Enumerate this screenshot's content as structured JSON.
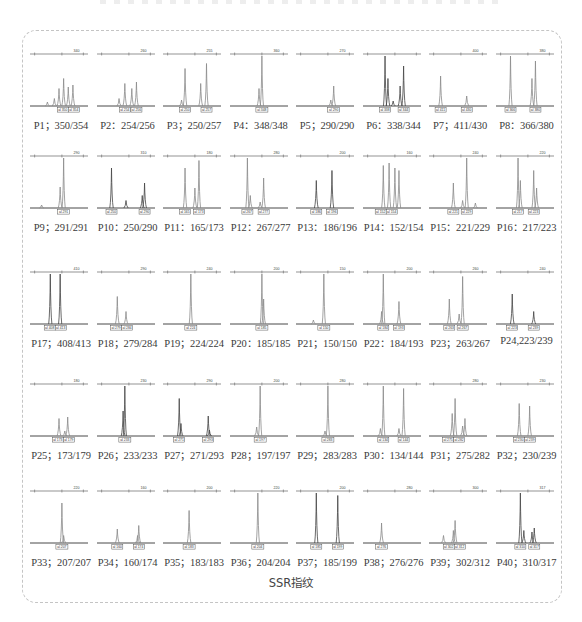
{
  "figure": {
    "caption": "SSR指纹",
    "grid": {
      "columns": 8,
      "rows": 5
    },
    "colors": {
      "trace": "#8a8a8a",
      "trace_dark": "#444444",
      "axis": "#555555",
      "frame": "#c4c4c4"
    }
  },
  "panels": [
    {
      "id": "P1",
      "label": "P1；350/354",
      "alleles": [
        "350",
        "354"
      ],
      "ruler": "340",
      "peaks": [
        [
          0.5,
          0.35
        ],
        [
          0.58,
          0.55
        ],
        [
          0.66,
          0.38
        ],
        [
          0.74,
          0.42
        ],
        [
          0.42,
          0.15
        ],
        [
          0.3,
          0.08
        ]
      ],
      "dark": false
    },
    {
      "id": "P2",
      "label": "P2：254/256",
      "alleles": [
        "254",
        "256"
      ],
      "ruler": "260",
      "peaks": [
        [
          0.48,
          0.45
        ],
        [
          0.6,
          0.35
        ],
        [
          0.68,
          0.48
        ],
        [
          0.38,
          0.15
        ]
      ],
      "dark": false
    },
    {
      "id": "P3",
      "label": "P3；250/257",
      "alleles": [
        "250",
        "257"
      ],
      "ruler": "255",
      "peaks": [
        [
          0.38,
          0.75
        ],
        [
          0.65,
          0.45
        ],
        [
          0.75,
          0.85
        ],
        [
          0.32,
          0.12
        ]
      ],
      "dark": false
    },
    {
      "id": "P4",
      "label": "P4：348/348",
      "alleles": [
        "348"
      ],
      "ruler": "360",
      "peaks": [
        [
          0.55,
          1.0
        ],
        [
          0.5,
          0.35
        ]
      ],
      "dark": false
    },
    {
      "id": "P5",
      "label": "P5；290/290",
      "alleles": [
        "290"
      ],
      "ruler": "270",
      "peaks": [
        [
          0.65,
          0.4
        ],
        [
          0.6,
          0.12
        ]
      ],
      "dark": false
    },
    {
      "id": "P6",
      "label": "P6：338/344",
      "alleles": [
        "338",
        "344"
      ],
      "ruler": "",
      "peaks": [
        [
          0.38,
          1.0
        ],
        [
          0.43,
          0.55
        ],
        [
          0.7,
          0.8
        ],
        [
          0.64,
          0.4
        ],
        [
          0.52,
          0.1
        ]
      ],
      "dark": true
    },
    {
      "id": "P7",
      "label": "P7；411/430",
      "alleles": [
        "411",
        "430"
      ],
      "ruler": "400",
      "peaks": [
        [
          0.2,
          0.6
        ],
        [
          0.65,
          0.2
        ]
      ],
      "dark": false
    },
    {
      "id": "P8",
      "label": "P8：366/380",
      "alleles": [
        "366",
        "380"
      ],
      "ruler": "380",
      "peaks": [
        [
          0.25,
          1.0
        ],
        [
          0.62,
          0.55
        ],
        [
          0.68,
          0.9
        ]
      ],
      "dark": false
    },
    {
      "id": "P9",
      "label": "P9；291/291",
      "alleles": [
        "291"
      ],
      "ruler": "290",
      "peaks": [
        [
          0.58,
          1.0
        ],
        [
          0.52,
          0.42
        ],
        [
          0.2,
          0.06
        ]
      ],
      "dark": false
    },
    {
      "id": "P10",
      "label": "P10：250/290",
      "alleles": [
        "250",
        "290"
      ],
      "ruler": "310",
      "peaks": [
        [
          0.25,
          0.8
        ],
        [
          0.5,
          0.15
        ],
        [
          0.82,
          0.5
        ],
        [
          0.78,
          0.25
        ]
      ],
      "dark": true
    },
    {
      "id": "P11",
      "label": "P11：165/173",
      "alleles": [
        "165",
        "173"
      ],
      "ruler": "180",
      "peaks": [
        [
          0.38,
          0.8
        ],
        [
          0.55,
          0.4
        ],
        [
          0.62,
          0.95
        ]
      ],
      "dark": false
    },
    {
      "id": "P12",
      "label": "P12：267/277",
      "alleles": [
        "267",
        "277"
      ],
      "ruler": "280",
      "peaks": [
        [
          0.3,
          1.0
        ],
        [
          0.35,
          0.25
        ],
        [
          0.58,
          0.6
        ],
        [
          0.52,
          0.12
        ]
      ],
      "dark": false
    },
    {
      "id": "P13",
      "label": "P13：186/196",
      "alleles": [
        "186",
        "196"
      ],
      "ruler": "200",
      "peaks": [
        [
          0.35,
          0.55
        ],
        [
          0.62,
          0.75
        ]
      ],
      "dark": true
    },
    {
      "id": "P14",
      "label": "P14：152/154",
      "alleles": [
        "152",
        "154"
      ],
      "ruler": "160",
      "peaks": [
        [
          0.35,
          0.85
        ],
        [
          0.45,
          0.9
        ],
        [
          0.55,
          0.8
        ],
        [
          0.62,
          0.75
        ]
      ],
      "dark": false
    },
    {
      "id": "P15",
      "label": "P15：221/229",
      "alleles": [
        "221",
        "229"
      ],
      "ruler": "240",
      "peaks": [
        [
          0.42,
          0.5
        ],
        [
          0.65,
          1.0
        ],
        [
          0.58,
          0.15
        ],
        [
          0.8,
          0.1
        ]
      ],
      "dark": false
    },
    {
      "id": "P16",
      "label": "P16：217/223",
      "alleles": [
        "217",
        "223"
      ],
      "ruler": "220",
      "peaks": [
        [
          0.38,
          1.0
        ],
        [
          0.42,
          0.55
        ],
        [
          0.65,
          0.75
        ],
        [
          0.7,
          0.4
        ]
      ],
      "dark": false
    },
    {
      "id": "P17",
      "label": "P17；408/413",
      "alleles": [
        "408",
        "413"
      ],
      "ruler": "410",
      "peaks": [
        [
          0.35,
          1.0
        ],
        [
          0.52,
          1.0
        ]
      ],
      "dark": true
    },
    {
      "id": "P18",
      "label": "P18；279/284",
      "alleles": [
        "279",
        "284"
      ],
      "ruler": "290",
      "peaks": [
        [
          0.35,
          0.55
        ],
        [
          0.5,
          0.25
        ]
      ],
      "dark": false
    },
    {
      "id": "P19",
      "label": "P19；224/224",
      "alleles": [
        "224"
      ],
      "ruler": "240",
      "peaks": [
        [
          0.48,
          1.0
        ]
      ],
      "dark": false
    },
    {
      "id": "P20",
      "label": "P20：185/185",
      "alleles": [
        "185"
      ],
      "ruler": "200",
      "peaks": [
        [
          0.55,
          1.0
        ],
        [
          0.58,
          0.5
        ]
      ],
      "dark": false
    },
    {
      "id": "P21",
      "label": "P21；150/150",
      "alleles": [
        "150"
      ],
      "ruler": "150",
      "peaks": [
        [
          0.48,
          1.0
        ],
        [
          0.3,
          0.08
        ]
      ],
      "dark": false
    },
    {
      "id": "P22",
      "label": "P22：184/193",
      "alleles": [
        "184",
        "193"
      ],
      "ruler": "200",
      "peaks": [
        [
          0.35,
          1.0
        ],
        [
          0.32,
          0.25
        ],
        [
          0.62,
          0.45
        ]
      ],
      "dark": false
    },
    {
      "id": "P23",
      "label": "P23；263/267",
      "alleles": [
        "263",
        "267"
      ],
      "ruler": "260",
      "peaks": [
        [
          0.35,
          0.5
        ],
        [
          0.58,
          0.95
        ],
        [
          0.52,
          0.2
        ]
      ],
      "dark": false
    },
    {
      "id": "P24",
      "label": "P24,223/239",
      "alleles": [
        "223",
        "239"
      ],
      "ruler": "240",
      "peaks": [
        [
          0.28,
          0.6
        ],
        [
          0.65,
          0.25
        ]
      ],
      "dark": true
    },
    {
      "id": "P25",
      "label": "P25；173/179",
      "alleles": [
        "173",
        "179"
      ],
      "ruler": "180",
      "peaks": [
        [
          0.5,
          0.35
        ],
        [
          0.65,
          0.38
        ],
        [
          0.6,
          0.1
        ]
      ],
      "dark": false
    },
    {
      "id": "P26",
      "label": "P26；233/233",
      "alleles": [
        "233"
      ],
      "ruler": "230",
      "peaks": [
        [
          0.48,
          1.0
        ],
        [
          0.45,
          0.5
        ]
      ],
      "dark": true
    },
    {
      "id": "P27",
      "label": "P27；271/293",
      "alleles": [
        "271",
        "293"
      ],
      "ruler": "290",
      "peaks": [
        [
          0.28,
          0.75
        ],
        [
          0.31,
          0.25
        ],
        [
          0.78,
          0.4
        ],
        [
          0.8,
          0.12
        ]
      ],
      "dark": true
    },
    {
      "id": "P28",
      "label": "P28；197/197",
      "alleles": [
        "197"
      ],
      "ruler": "200",
      "peaks": [
        [
          0.52,
          1.0
        ],
        [
          0.46,
          0.18
        ]
      ],
      "dark": false
    },
    {
      "id": "P29",
      "label": "P29；283/283",
      "alleles": [
        "283"
      ],
      "ruler": "280",
      "peaks": [
        [
          0.55,
          1.0
        ],
        [
          0.5,
          0.1
        ]
      ],
      "dark": false
    },
    {
      "id": "P30",
      "label": "P30：134/144",
      "alleles": [
        "134",
        "144"
      ],
      "ruler": "",
      "peaks": [
        [
          0.35,
          1.0
        ],
        [
          0.7,
          0.95
        ],
        [
          0.3,
          0.15
        ],
        [
          0.62,
          0.15
        ]
      ],
      "dark": false
    },
    {
      "id": "P31",
      "label": "P31；275/282",
      "alleles": [
        "275",
        "282"
      ],
      "ruler": "280",
      "peaks": [
        [
          0.45,
          0.75
        ],
        [
          0.4,
          0.45
        ],
        [
          0.62,
          0.35
        ],
        [
          0.58,
          0.2
        ]
      ],
      "dark": false
    },
    {
      "id": "P32",
      "label": "P32；230/239",
      "alleles": [
        "230",
        "239"
      ],
      "ruler": "230",
      "peaks": [
        [
          0.4,
          0.65
        ],
        [
          0.58,
          0.6
        ]
      ],
      "dark": false
    },
    {
      "id": "P33",
      "label": "P33；207/207",
      "alleles": [
        "207"
      ],
      "ruler": "220",
      "peaks": [
        [
          0.55,
          0.8
        ],
        [
          0.58,
          0.15
        ]
      ],
      "dark": false
    },
    {
      "id": "P34",
      "label": "P34；160/174",
      "alleles": [
        "160",
        "174"
      ],
      "ruler": "160",
      "peaks": [
        [
          0.35,
          0.28
        ],
        [
          0.72,
          0.35
        ],
        [
          0.7,
          0.15
        ]
      ],
      "dark": false
    },
    {
      "id": "P35",
      "label": "P35；183/183",
      "alleles": [
        "183"
      ],
      "ruler": "200",
      "peaks": [
        [
          0.45,
          0.65
        ]
      ],
      "dark": false
    },
    {
      "id": "P36",
      "label": "P36；204/204",
      "alleles": [
        "204"
      ],
      "ruler": "220",
      "peaks": [
        [
          0.48,
          1.0
        ]
      ],
      "dark": false
    },
    {
      "id": "P37",
      "label": "P37；185/199",
      "alleles": [
        "185",
        "199"
      ],
      "ruler": "200",
      "peaks": [
        [
          0.35,
          1.0
        ],
        [
          0.72,
          0.95
        ]
      ],
      "dark": true
    },
    {
      "id": "P38",
      "label": "P38；276/276",
      "alleles": [
        "276"
      ],
      "ruler": "280",
      "peaks": [
        [
          0.32,
          0.4
        ]
      ],
      "dark": false
    },
    {
      "id": "P39",
      "label": "P39；302/312",
      "alleles": [
        "302",
        "312"
      ],
      "ruler": "300",
      "peaks": [
        [
          0.25,
          0.15
        ],
        [
          0.45,
          0.45
        ],
        [
          0.42,
          0.25
        ]
      ],
      "dark": false
    },
    {
      "id": "P40",
      "label": "P40；310/317",
      "alleles": [
        "310",
        "317"
      ],
      "ruler": "317",
      "peaks": [
        [
          0.42,
          1.0
        ],
        [
          0.48,
          0.25
        ],
        [
          0.62,
          0.22
        ],
        [
          0.66,
          0.3
        ]
      ],
      "dark": true
    }
  ]
}
